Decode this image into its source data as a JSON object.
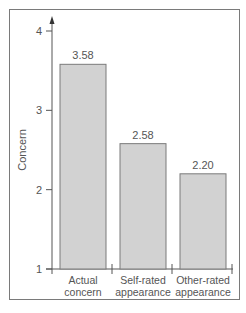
{
  "chart_data": {
    "type": "bar",
    "title": "",
    "xlabel": "",
    "ylabel": "Concern",
    "ylim": [
      1,
      4
    ],
    "yticks": [
      1,
      2,
      3,
      4
    ],
    "categories": [
      "Actual concern",
      "Self-rated appearance",
      "Other-rated appearance"
    ],
    "category_lines": [
      [
        "Actual",
        "concern"
      ],
      [
        "Self-rated",
        "appearance"
      ],
      [
        "Other-rated",
        "appearance"
      ]
    ],
    "values": [
      3.58,
      2.58,
      2.2
    ],
    "value_labels": [
      "3.58",
      "2.58",
      "2.20"
    ],
    "grid": false,
    "legend": null,
    "bar_color": "#d2d2d2",
    "bar_edge_color": "#7a7a7a"
  },
  "axis": {
    "ylabel": "Concern",
    "ticks": [
      "1",
      "2",
      "3",
      "4"
    ]
  }
}
